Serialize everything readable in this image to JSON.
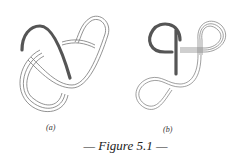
{
  "figure": {
    "caption": "— Figure 5.1 —",
    "panels": [
      {
        "id": "a",
        "label": "(a)",
        "description": "knot diagram with one dark strand and multi-line strands"
      },
      {
        "id": "b",
        "label": "(b)",
        "description": "knot diagram with dark loop and multi-line loops"
      }
    ]
  },
  "colors": {
    "dark_strand": "#555555",
    "line_strand": "#777777",
    "background": "#ffffff"
  }
}
